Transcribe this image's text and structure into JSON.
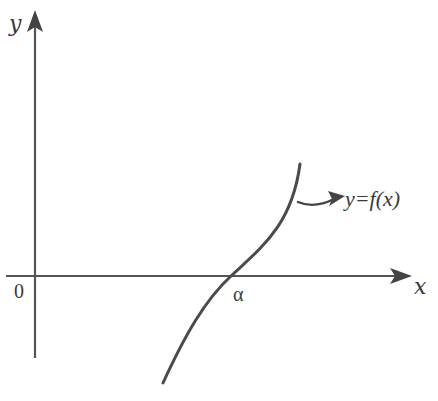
{
  "diagram": {
    "type": "function-graph",
    "axes": {
      "x_label": "x",
      "y_label": "y",
      "origin_label": "0"
    },
    "curve": {
      "label": "y=f(x)",
      "root_label": "α",
      "description": "Increasing curve crossing the x-axis at α, concave down below the axis and concave up above it"
    },
    "colors": {
      "axis": "#555555",
      "curve": "#4a4a4a",
      "text": "#3a3a3a"
    }
  }
}
